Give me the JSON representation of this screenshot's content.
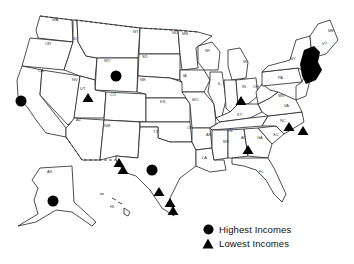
{
  "map": {
    "title": "",
    "state_labels": [
      {
        "code": "WA",
        "x": 52,
        "y": 21
      },
      {
        "code": "OR",
        "x": 45,
        "y": 45
      },
      {
        "code": "ID",
        "x": 73,
        "y": 40
      },
      {
        "code": "MT",
        "x": 133,
        "y": 33
      },
      {
        "code": "ND",
        "x": 172,
        "y": 34
      },
      {
        "code": "MN",
        "x": 182,
        "y": 35
      },
      {
        "code": "WY",
        "x": 104,
        "y": 62
      },
      {
        "code": "SD",
        "x": 142,
        "y": 58
      },
      {
        "code": "CA",
        "x": 38,
        "y": 72
      },
      {
        "code": "NV",
        "x": 72,
        "y": 81
      },
      {
        "code": "UT",
        "x": 80,
        "y": 90
      },
      {
        "code": "CO",
        "x": 110,
        "y": 96
      },
      {
        "code": "NE",
        "x": 140,
        "y": 81
      },
      {
        "code": "IA",
        "x": 183,
        "y": 77
      },
      {
        "code": "KS",
        "x": 160,
        "y": 103
      },
      {
        "code": "MO",
        "x": 192,
        "y": 101
      },
      {
        "code": "IL",
        "x": 218,
        "y": 85
      },
      {
        "code": "WI",
        "x": 205,
        "y": 52
      },
      {
        "code": "MI",
        "x": 243,
        "y": 63
      },
      {
        "code": "IN",
        "x": 242,
        "y": 88
      },
      {
        "code": "OH",
        "x": 253,
        "y": 88
      },
      {
        "code": "PA",
        "x": 278,
        "y": 79
      },
      {
        "code": "NY",
        "x": 290,
        "y": 60
      },
      {
        "code": "ME",
        "x": 328,
        "y": 32
      },
      {
        "code": "VT",
        "x": 322,
        "y": 45
      },
      {
        "code": "KY",
        "x": 237,
        "y": 116
      },
      {
        "code": "WV",
        "x": 278,
        "y": 97
      },
      {
        "code": "VA",
        "x": 284,
        "y": 107
      },
      {
        "code": "TN",
        "x": 227,
        "y": 132
      },
      {
        "code": "NC",
        "x": 280,
        "y": 122
      },
      {
        "code": "SC",
        "x": 273,
        "y": 136
      },
      {
        "code": "GA",
        "x": 257,
        "y": 139
      },
      {
        "code": "AL",
        "x": 241,
        "y": 139
      },
      {
        "code": "MS",
        "x": 223,
        "y": 143
      },
      {
        "code": "LA",
        "x": 202,
        "y": 159
      },
      {
        "code": "AR",
        "x": 206,
        "y": 136
      },
      {
        "code": "OK",
        "x": 187,
        "y": 129
      },
      {
        "code": "TX",
        "x": 153,
        "y": 133
      },
      {
        "code": "NM",
        "x": 104,
        "y": 127
      },
      {
        "code": "AZ",
        "x": 76,
        "y": 121
      },
      {
        "code": "FL",
        "x": 259,
        "y": 173
      },
      {
        "code": "AK",
        "x": 47,
        "y": 173
      },
      {
        "code": "HI",
        "x": 110,
        "y": 208
      }
    ],
    "markers": {
      "highest": [
        {
          "state": "CA",
          "x": 21,
          "y": 101
        },
        {
          "state": "WY",
          "x": 116,
          "y": 76
        },
        {
          "state": "TX",
          "x": 152,
          "y": 170
        },
        {
          "state": "AK",
          "x": 53,
          "y": 201
        },
        {
          "state": "NJ/NY/CT",
          "x": 310,
          "y": 66
        }
      ],
      "lowest": [
        {
          "state": "UT",
          "x": 88,
          "y": 98
        },
        {
          "state": "IN",
          "x": 241,
          "y": 101
        },
        {
          "state": "NC",
          "x": 289,
          "y": 127
        },
        {
          "state": "NC-coast",
          "x": 303,
          "y": 131
        },
        {
          "state": "AL",
          "x": 248,
          "y": 150
        },
        {
          "state": "TX-west1",
          "x": 119,
          "y": 163
        },
        {
          "state": "TX-west2",
          "x": 123,
          "y": 170
        },
        {
          "state": "TX-south1",
          "x": 159,
          "y": 192
        },
        {
          "state": "TX-south2",
          "x": 170,
          "y": 203
        },
        {
          "state": "TX-south3",
          "x": 173,
          "y": 211
        }
      ]
    },
    "colors": {
      "marker": "#000000",
      "outline": "#222222",
      "background": "#ffffff"
    }
  },
  "legend": {
    "highest_label": "Highest Incomes",
    "lowest_label": "Lowest Incomes",
    "highest_icon": "circle-icon",
    "lowest_icon": "triangle-icon"
  }
}
